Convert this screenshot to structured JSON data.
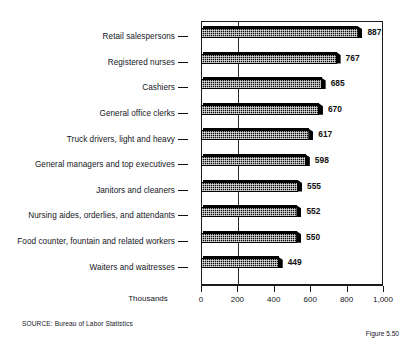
{
  "chart_data": {
    "type": "bar",
    "orientation": "horizontal",
    "title": "",
    "xlabel": "Thousands",
    "ylabel": "",
    "xlim": [
      0,
      1000
    ],
    "grid": true,
    "gridlines_at": [
      200
    ],
    "legend": "none",
    "categories": [
      "Retail salespersons",
      "Registered nurses",
      "Cashiers",
      "General office clerks",
      "Truck drivers, light and heavy",
      "General managers and top executives",
      "Janitors and cleaners",
      "Nursing aides, orderlies, and attendants",
      "Food counter, fountain and related workers",
      "Waiters and waitresses"
    ],
    "values": [
      887,
      767,
      685,
      670,
      617,
      598,
      555,
      552,
      550,
      449
    ],
    "value_labels": [
      "887",
      "767",
      "685",
      "670",
      "617",
      "598",
      "555",
      "552",
      "550",
      "449"
    ],
    "xticks": [
      0,
      200,
      400,
      600,
      800,
      1000
    ],
    "xticklabels": [
      "0",
      "200",
      "400",
      "600",
      "800",
      "1,000"
    ]
  },
  "axis": {
    "units_label": "Thousands"
  },
  "footer": {
    "source": "SOURCE:  Bureau of Labor Statistics",
    "figure": "Figure 5.50"
  },
  "colors": {
    "bar": "#0b0b0b",
    "frame": "#1a1a1a",
    "text": "#15151c",
    "background": "#ffffff"
  }
}
